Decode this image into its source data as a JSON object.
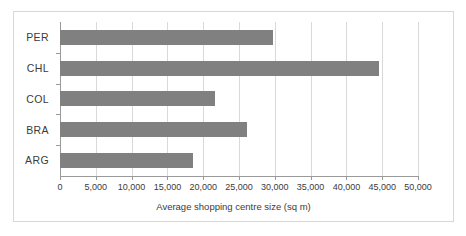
{
  "chart_data": {
    "type": "bar",
    "orientation": "horizontal",
    "title": "",
    "xlabel": "Average shopping centre size (sq m)",
    "ylabel": "",
    "categories": [
      "PER",
      "CHL",
      "COL",
      "BRA",
      "ARG"
    ],
    "values": [
      29700,
      44500,
      21600,
      26100,
      18600
    ],
    "series": [
      {
        "name": "Average shopping centre size (sq m)",
        "values": [
          29700,
          44500,
          21600,
          26100,
          18600
        ]
      }
    ],
    "xlim": [
      0,
      50000
    ],
    "xticks": [
      0,
      5000,
      10000,
      15000,
      20000,
      25000,
      30000,
      35000,
      40000,
      45000,
      50000
    ],
    "xtick_labels": [
      "0",
      "5,000",
      "10,000",
      "15,000",
      "20,000",
      "25,000",
      "30,000",
      "35,000",
      "40,000",
      "45,000",
      "50,000"
    ],
    "grid": true,
    "grid_axis": "x",
    "legend": false,
    "bar_color": "#808080",
    "gridline_color": "#d9d9d9",
    "axis_color": "#9a9a9a",
    "background_color": "#ffffff",
    "border_color": "#d8d8d8"
  }
}
